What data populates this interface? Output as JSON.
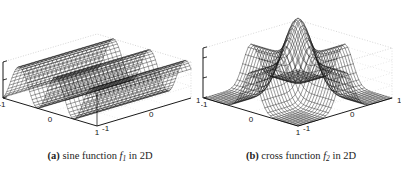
{
  "figure": {
    "panels": [
      {
        "id": "a",
        "caption_tag": "(a)",
        "caption_text_1": "sine function",
        "caption_fn": "f",
        "caption_fn_sub": "1",
        "caption_text_2": "in 2D",
        "axes": {
          "z_ticks": [
            "1",
            "0",
            "-1"
          ],
          "x_ticks": [
            "-1",
            "0",
            "1"
          ],
          "y_ticks": [
            "-1",
            "0",
            "1"
          ]
        }
      },
      {
        "id": "b",
        "caption_tag": "(b)",
        "caption_text_1": "cross function",
        "caption_fn": "f",
        "caption_fn_sub": "2",
        "caption_text_2": "in 2D",
        "axes": {
          "z_ticks": [
            "1.25",
            "1",
            "0.5",
            "0"
          ],
          "x_ticks": [
            "-1",
            "0",
            "1"
          ],
          "y_ticks": [
            "-1",
            "0",
            "1"
          ]
        }
      }
    ]
  },
  "chart_data": [
    {
      "type": "surface",
      "panel": "a",
      "title": "sine function f1 in 2D",
      "xlabel": "x1",
      "ylabel": "x2",
      "zlabel": "f1",
      "xlim": [
        -1,
        1
      ],
      "ylim": [
        -1,
        1
      ],
      "zlim": [
        -1,
        1
      ],
      "xticks": [
        -1,
        0,
        1
      ],
      "yticks": [
        -1,
        0,
        1
      ],
      "zticks": [
        -1,
        0,
        1
      ],
      "grid": true,
      "legend": "none",
      "formula": "sin(2*pi*1.5*x) ridge repeated along y",
      "mesh": {
        "nx": 60,
        "ny": 26
      },
      "style": "wireframe-dense-black"
    },
    {
      "type": "surface",
      "panel": "b",
      "title": "cross function f2 in 2D",
      "xlabel": "x1",
      "ylabel": "x2",
      "zlabel": "f2",
      "xlim": [
        -1,
        1
      ],
      "ylim": [
        -1,
        1
      ],
      "zlim": [
        0,
        1.25
      ],
      "xticks": [
        -1,
        0,
        1
      ],
      "yticks": [
        -1,
        0,
        1
      ],
      "zticks": [
        0,
        0.5,
        1,
        1.25
      ],
      "grid": true,
      "legend": "none",
      "formula": "exp(-x^2/s) + exp(-y^2/s) crossing ridges",
      "mesh": {
        "nx": 26,
        "ny": 26
      },
      "style": "wireframe-black"
    }
  ]
}
